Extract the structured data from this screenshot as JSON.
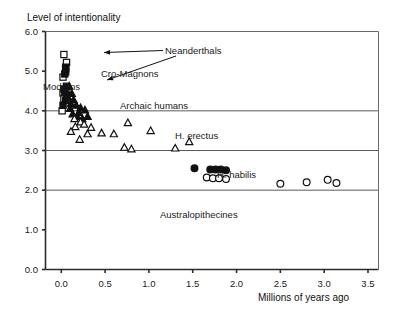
{
  "figure": {
    "background": "#ffffff",
    "ink": "#000000",
    "plot_border_color": "#555555"
  },
  "chart_data": {
    "type": "scatter",
    "title": "",
    "ylabel": "Level of intentionality",
    "xlabel": "Millions of years ago",
    "xlim": [
      -0.18,
      3.62
    ],
    "ylim": [
      0.0,
      6.0
    ],
    "xticks": [
      0.0,
      0.5,
      1.0,
      1.5,
      2.0,
      2.5,
      3.0,
      3.5
    ],
    "xticklabels": [
      "0.0",
      "0.5",
      "1.0",
      "1.5",
      "2.0",
      "2.5",
      "3.0",
      "3.5"
    ],
    "yticks": [
      0.0,
      1.0,
      2.0,
      3.0,
      4.0,
      5.0,
      6.0
    ],
    "yticklabels": [
      "0.0",
      "1.0",
      "2.0",
      "3.0",
      "4.0",
      "5.0",
      "6.0"
    ],
    "grid": "horizontal gridlines at y = 2.0, 3.0, 4.0",
    "legend": "none (inline annotations instead)",
    "series": [
      {
        "name": "Cro-Magnons",
        "marker": "open-square",
        "points": [
          [
            0.03,
            5.42
          ],
          [
            0.06,
            5.22
          ],
          [
            0.05,
            4.98
          ],
          [
            0.02,
            4.85
          ],
          [
            0.06,
            4.62
          ],
          [
            0.02,
            4.45
          ],
          [
            0.03,
            4.3
          ],
          [
            0.01,
            4.0
          ]
        ]
      },
      {
        "name": "Moderns",
        "marker": "filled-square",
        "points": [
          [
            0.05,
            5.1
          ],
          [
            0.04,
            4.93
          ],
          [
            0.03,
            4.55
          ],
          [
            0.06,
            4.4
          ],
          [
            0.05,
            4.26
          ],
          [
            0.02,
            4.14
          ]
        ]
      },
      {
        "name": "Neanderthals",
        "marker": "filled-square",
        "points": [
          [
            0.05,
            5.05
          ],
          [
            0.06,
            4.6
          ],
          [
            0.04,
            4.47
          ]
        ]
      },
      {
        "name": "Archaic humans",
        "marker": "filled-triangle",
        "points": [
          [
            0.09,
            4.62
          ],
          [
            0.12,
            4.44
          ],
          [
            0.08,
            4.33
          ],
          [
            0.14,
            4.28
          ],
          [
            0.11,
            4.18
          ],
          [
            0.17,
            4.14
          ],
          [
            0.22,
            4.08
          ],
          [
            0.27,
            4.02
          ],
          [
            0.13,
            3.92
          ],
          [
            0.18,
            3.86
          ],
          [
            0.24,
            3.8
          ],
          [
            0.3,
            3.86
          ],
          [
            0.1,
            4.06
          ],
          [
            0.2,
            3.96
          ]
        ]
      },
      {
        "name": "H. erectus",
        "marker": "open-triangle",
        "points": [
          [
            0.15,
            3.8
          ],
          [
            0.22,
            3.72
          ],
          [
            0.16,
            3.6
          ],
          [
            0.26,
            3.66
          ],
          [
            0.11,
            3.48
          ],
          [
            0.34,
            3.58
          ],
          [
            0.3,
            3.42
          ],
          [
            0.46,
            3.44
          ],
          [
            0.21,
            3.28
          ],
          [
            0.6,
            3.42
          ],
          [
            0.76,
            3.7
          ],
          [
            0.72,
            3.08
          ],
          [
            0.8,
            3.04
          ],
          [
            1.02,
            3.5
          ],
          [
            1.3,
            3.06
          ],
          [
            1.46,
            3.22
          ]
        ]
      },
      {
        "name": "H. habilis",
        "marker": "filled-circle",
        "points": [
          [
            1.52,
            2.55
          ],
          [
            1.7,
            2.52
          ],
          [
            1.76,
            2.52
          ],
          [
            1.82,
            2.52
          ],
          [
            1.88,
            2.5
          ]
        ]
      },
      {
        "name": "Australopithecines",
        "marker": "open-circle",
        "points": [
          [
            1.66,
            2.32
          ],
          [
            1.73,
            2.3
          ],
          [
            1.8,
            2.3
          ],
          [
            1.88,
            2.28
          ],
          [
            2.5,
            2.16
          ],
          [
            2.8,
            2.2
          ],
          [
            3.04,
            2.26
          ],
          [
            3.14,
            2.18
          ]
        ]
      }
    ],
    "annotations": [
      {
        "text": "Neanderthals",
        "name": "annotation-neanderthals"
      },
      {
        "text": "Cro-Magnons",
        "name": "annotation-cro-magnons"
      },
      {
        "text": "Moderns",
        "name": "annotation-moderns"
      },
      {
        "text": "Archaic humans",
        "name": "annotation-archaic-humans"
      },
      {
        "text": "H. erectus",
        "name": "annotation-h-erectus"
      },
      {
        "text": "H. habilis",
        "name": "annotation-h-habilis"
      },
      {
        "text": "Australopithecines",
        "name": "annotation-australopithecines"
      }
    ]
  }
}
